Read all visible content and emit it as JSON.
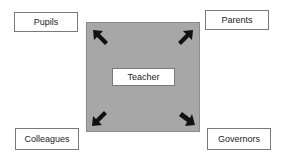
{
  "diagram": {
    "center": {
      "label": "Teacher"
    },
    "nodes": [
      {
        "label": "Pupils",
        "position": "top-left"
      },
      {
        "label": "Parents",
        "position": "top-right"
      },
      {
        "label": "Colleagues",
        "position": "bottom-left"
      },
      {
        "label": "Governors",
        "position": "bottom-right"
      }
    ],
    "colors": {
      "square": "#a7a7a7",
      "arrow": "#111111",
      "box_border": "#7a7a7a"
    }
  }
}
